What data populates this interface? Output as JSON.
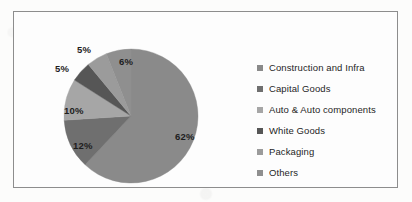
{
  "chart_data": {
    "type": "pie",
    "title": "",
    "categories": [
      "Construction and Infra",
      "Capital Goods",
      "Auto & Auto components",
      "White Goods",
      "Packaging",
      "Others"
    ],
    "values": [
      62,
      12,
      10,
      5,
      5,
      6
    ],
    "data_labels": [
      "62%",
      "12%",
      "10%",
      "5%",
      "5%",
      "6%"
    ],
    "colors": [
      "#8a8a8a",
      "#6f6f6f",
      "#a6a6a6",
      "#565656",
      "#9b9b9b",
      "#8f8f8f"
    ],
    "units": "percent",
    "legend_position": "right",
    "grid": false,
    "start_angle_deg": 0,
    "direction": "clockwise"
  },
  "legend": {
    "items": [
      {
        "label": "Construction and Infra",
        "color": "#8a8a8a"
      },
      {
        "label": "Capital Goods",
        "color": "#6f6f6f"
      },
      {
        "label": "Auto & Auto components",
        "color": "#a6a6a6"
      },
      {
        "label": "White Goods",
        "color": "#565656"
      },
      {
        "label": "Packaging",
        "color": "#9b9b9b"
      },
      {
        "label": "Others",
        "color": "#8f8f8f"
      }
    ]
  },
  "slice_labels": [
    {
      "text": "62%",
      "left": 112,
      "top": 83
    },
    {
      "text": "12%",
      "left": 10,
      "top": 92
    },
    {
      "text": "10%",
      "left": 1,
      "top": 57
    },
    {
      "text": "5%",
      "left": -8,
      "top": 15
    },
    {
      "text": "5%",
      "left": 14,
      "top": -4
    },
    {
      "text": "6%",
      "left": 56,
      "top": 8
    }
  ],
  "frame": {
    "border_color": "#8d8d8d"
  }
}
